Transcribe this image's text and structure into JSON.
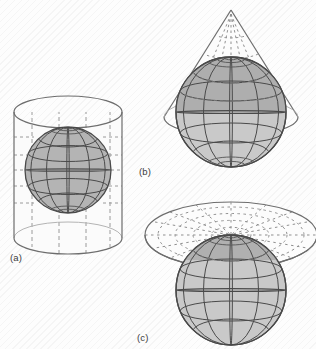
{
  "figure": {
    "width": 316,
    "height": 349,
    "background_color": "#fdfdfd"
  },
  "colors": {
    "globe_fill_dark": "#b2b2b2",
    "globe_fill_light": "#c9c9c9",
    "graticule_line": "#4a4a4a",
    "surface_outline": "#6d6d6d",
    "projected_line": "#8a8a8a",
    "label_text": "#3b3b3b",
    "polar_cap": "#8f8f8f"
  },
  "panels": [
    {
      "id": "a",
      "label": "(a)",
      "surface": "cylinder",
      "surface_name": "cylindrical-projection-surface",
      "globe_name": "globe-cylindrical",
      "tangency": "equator",
      "projected_graticule_style": "dashed",
      "center": {
        "x": 67,
        "y": 170
      },
      "globe_radius": 43
    },
    {
      "id": "b",
      "label": "(b)",
      "surface": "cone",
      "surface_name": "conical-projection-surface",
      "globe_name": "globe-conical",
      "tangency": "standard-parallel",
      "projected_graticule_style": "dashed",
      "center": {
        "x": 230,
        "y": 110
      },
      "globe_radius": 55
    },
    {
      "id": "c",
      "label": "(c)",
      "surface": "plane",
      "surface_name": "planar-projection-surface",
      "globe_name": "globe-planar",
      "tangency": "north-pole",
      "projected_graticule_style": "dashed",
      "center": {
        "x": 230,
        "y": 287
      },
      "globe_radius": 55
    }
  ],
  "graticule": {
    "parallels_count": 5,
    "meridians_count": 6,
    "globe_outline_color": "#4a4a4a"
  }
}
